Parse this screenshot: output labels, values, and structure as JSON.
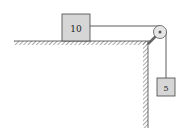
{
  "diagram": {
    "type": "physics-pulley-system",
    "block_on_table": {
      "label": "10",
      "fill": "#d8d8d8"
    },
    "hanging_block": {
      "label": "5",
      "fill": "#d8d8d8"
    },
    "colors": {
      "line": "#333333",
      "hatch": "#555555"
    }
  }
}
